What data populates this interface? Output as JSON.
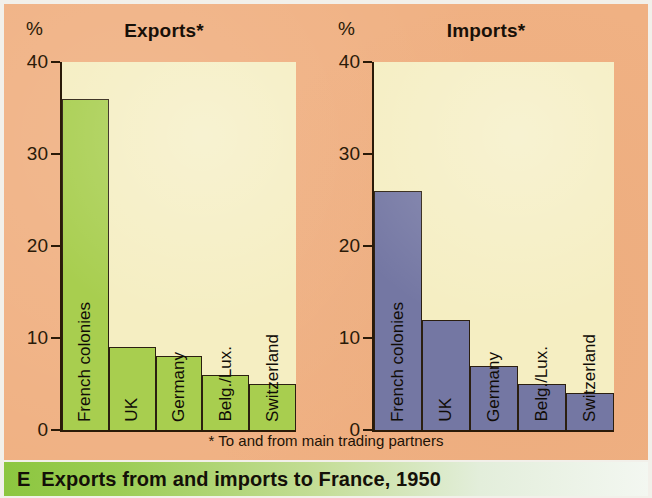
{
  "figure": {
    "letter": "E",
    "caption": "Exports from and imports to France, 1950",
    "footnote": "* To and from main trading partners",
    "percent_symbol": "%"
  },
  "colors": {
    "background": "#f0b183",
    "plot_area": "#f5eec2",
    "exports_bar": "#a8ce4f",
    "imports_bar": "#7477a3",
    "axis": "#2a1a08",
    "caption_gradient_start": "#8cc63f",
    "caption_gradient_end": "#f3f7f1"
  },
  "chart_data": [
    {
      "type": "bar",
      "title": "Exports*",
      "xlabel": "",
      "ylabel": "%",
      "ylim": [
        0,
        40
      ],
      "yticks": [
        0,
        10,
        20,
        30,
        40
      ],
      "grid": false,
      "legend": "none",
      "categories": [
        "French colonies",
        "UK",
        "Germany",
        "Belg./Lux.",
        "Switzerland"
      ],
      "values": [
        36,
        9,
        8,
        6,
        5
      ]
    },
    {
      "type": "bar",
      "title": "Imports*",
      "xlabel": "",
      "ylabel": "%",
      "ylim": [
        0,
        40
      ],
      "yticks": [
        0,
        10,
        20,
        30,
        40
      ],
      "grid": false,
      "legend": "none",
      "categories": [
        "French colonies",
        "UK",
        "Germany",
        "Belg./Lux.",
        "Switzerland"
      ],
      "values": [
        26,
        12,
        7,
        5,
        4
      ]
    }
  ]
}
